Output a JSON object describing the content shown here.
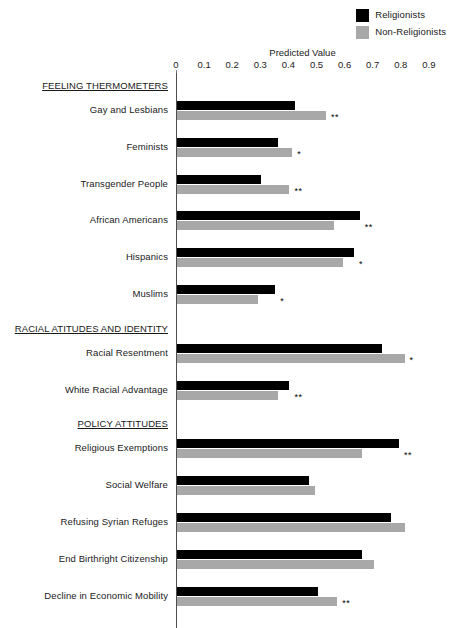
{
  "chart_data": {
    "type": "bar",
    "orientation": "horizontal",
    "title": "",
    "xlabel": "Predicted Value",
    "ylabel": "",
    "xlim": [
      0,
      0.9
    ],
    "xticks": [
      "0",
      "0.1",
      "0.2",
      "0.3",
      "0.4",
      "0.5",
      "0.6",
      "0.7",
      "0.8",
      "0.9"
    ],
    "xtick_values": [
      0,
      0.1,
      0.2,
      0.3,
      0.4,
      0.5,
      0.6,
      0.7,
      0.8,
      0.9
    ],
    "grid": false,
    "legend_position": "top-right",
    "series": [
      {
        "name": "Religionists",
        "color": "#000000"
      },
      {
        "name": "Non-Religionists",
        "color": "#a8a8a8"
      }
    ],
    "sections": [
      {
        "heading": "FEELING THERMOMETERS",
        "items": [
          {
            "label": "Gay and Lesbians",
            "religionists": 0.42,
            "non_religionists": 0.53,
            "significance": "**"
          },
          {
            "label": "Feminists",
            "religionists": 0.36,
            "non_religionists": 0.41,
            "significance": "*"
          },
          {
            "label": "Transgender People",
            "religionists": 0.3,
            "non_religionists": 0.4,
            "significance": "**"
          },
          {
            "label": "African Americans",
            "religionists": 0.65,
            "non_religionists": 0.56,
            "significance": "**"
          },
          {
            "label": "Hispanics",
            "religionists": 0.63,
            "non_religionists": 0.59,
            "significance": "*"
          },
          {
            "label": "Muslims",
            "religionists": 0.35,
            "non_religionists": 0.29,
            "significance": "*"
          }
        ]
      },
      {
        "heading": "RACIAL ATITUDES AND IDENTITY",
        "items": [
          {
            "label": "Racial Resentment",
            "religionists": 0.73,
            "non_religionists": 0.81,
            "significance": "*"
          },
          {
            "label": "White Racial Advantage",
            "religionists": 0.4,
            "non_religionists": 0.36,
            "significance": "**"
          }
        ]
      },
      {
        "heading": "POLICY ATTITUDES",
        "items": [
          {
            "label": "Religious Exemptions",
            "religionists": 0.79,
            "non_religionists": 0.66,
            "significance": "**"
          },
          {
            "label": "Social Welfare",
            "religionists": 0.47,
            "non_religionists": 0.49,
            "significance": ""
          },
          {
            "label": "Refusing Syrian Refuges",
            "religionists": 0.76,
            "non_religionists": 0.81,
            "significance": ""
          },
          {
            "label": "End Birthright Citizenship",
            "religionists": 0.66,
            "non_religionists": 0.7,
            "significance": ""
          },
          {
            "label": "Decline in Economic Mobility",
            "religionists": 0.5,
            "non_religionists": 0.57,
            "significance": "**"
          }
        ]
      }
    ]
  }
}
